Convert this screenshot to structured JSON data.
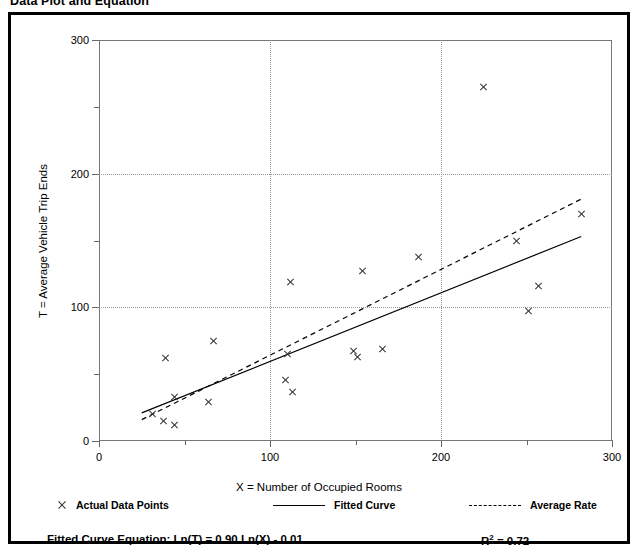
{
  "page_title": "Data Plot and Equation",
  "chart_data": {
    "type": "scatter",
    "title": "Data Plot and Equation",
    "xlabel": "X = Number of Occupied Rooms",
    "ylabel": "T = Average Vehicle Trip Ends",
    "xlim": [
      0,
      300
    ],
    "ylim": [
      0,
      300
    ],
    "x_ticks_major": [
      0,
      100,
      200,
      300
    ],
    "x_ticks_minor": [
      50,
      150,
      250
    ],
    "y_ticks_major": [
      0,
      100,
      200,
      300
    ],
    "y_ticks_minor": [
      50,
      150,
      250
    ],
    "x_tick_labels": [
      "0",
      "100",
      "200",
      "300"
    ],
    "y_tick_labels": [
      "0",
      "100",
      "200",
      "300"
    ],
    "grid": "dotted gridlines at x=100,200 and y=100,200",
    "legend_position": "below-plot",
    "series": [
      {
        "name": "Actual Data Points",
        "type": "scatter",
        "marker": "x",
        "points": [
          [
            31,
            20
          ],
          [
            38,
            15
          ],
          [
            44,
            12
          ],
          [
            44,
            33
          ],
          [
            39,
            62
          ],
          [
            64,
            29
          ],
          [
            67,
            75
          ],
          [
            109,
            46
          ],
          [
            113,
            37
          ],
          [
            112,
            119
          ],
          [
            110,
            65
          ],
          [
            149,
            67
          ],
          [
            151,
            63
          ],
          [
            154,
            127
          ],
          [
            166,
            69
          ],
          [
            187,
            138
          ],
          [
            225,
            265
          ],
          [
            244,
            150
          ],
          [
            251,
            97
          ],
          [
            257,
            116
          ],
          [
            282,
            170
          ]
        ]
      },
      {
        "name": "Fitted Curve",
        "type": "line",
        "style": "solid",
        "equation": "Ln(T) = 0.90 Ln(X) - 0.01",
        "endpoints": [
          [
            25,
            21
          ],
          [
            282,
            153
          ]
        ]
      },
      {
        "name": "Average Rate",
        "type": "line",
        "style": "dashed",
        "endpoints": [
          [
            25,
            16
          ],
          [
            282,
            181
          ]
        ]
      }
    ],
    "annotations": {
      "equation_label": "Fitted Curve Equation:",
      "equation_value": "Ln(T) = 0.90 Ln(X) - 0.01",
      "r_squared_label": "R",
      "r_squared_exponent": "2",
      "r_squared_value": "= 0.72"
    }
  },
  "legend": {
    "actual_label": "Actual Data Points",
    "fitted_label": "Fitted Curve",
    "average_label": "Average Rate"
  },
  "equation": {
    "prefix": "Fitted Curve Equation:  Ln(T) = 0.90 Ln(X) - 0.01",
    "r_text_before": "R",
    "r_superscript": "2",
    "r_text_after": " = 0.72"
  }
}
